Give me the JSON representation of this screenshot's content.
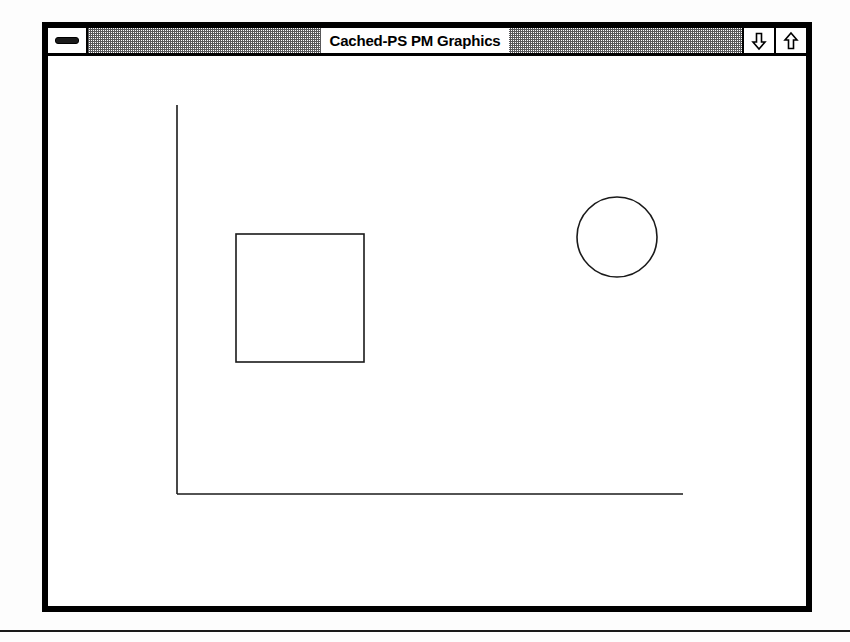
{
  "window": {
    "title": "Cached-PS PM Graphics",
    "frame": {
      "x": 42,
      "y": 22,
      "width": 770,
      "height": 590,
      "border_color": "#000000",
      "border_width": 6
    },
    "titlebar": {
      "height": 28,
      "style": "dithered-50-percent-gray",
      "pattern_color": "#58585a",
      "background_color": "#ffffff",
      "title_plate_color": "#ffffff",
      "title_text_color": "#000000",
      "sysmenu": {
        "name": "system-menu-button",
        "glyph": "dash",
        "tooltip": "System Menu"
      },
      "buttons": [
        {
          "name": "minimize-button",
          "glyph": "arrow-down",
          "label": "Minimize"
        },
        {
          "name": "maximize-button",
          "glyph": "arrow-up",
          "label": "Maximize"
        }
      ]
    },
    "client": {
      "background_color": "#ffffff",
      "width": 758,
      "height": 559
    }
  },
  "chart_data": {
    "type": "line",
    "title": "Cached-PS PM Graphics",
    "xlabel": "",
    "ylabel": "",
    "grid": false,
    "legend": "none",
    "stroke_color": "#1a1a1a",
    "stroke_width": 1.6,
    "canvas": {
      "width": 758,
      "height": 559
    },
    "annotations": [],
    "shapes": [
      {
        "name": "y-axis-line",
        "kind": "line",
        "x1": 129,
        "y1": 49,
        "x2": 129,
        "y2": 438,
        "stroke": "#1a1a1a",
        "stroke_width": 1.6
      },
      {
        "name": "x-axis-line",
        "kind": "line",
        "x1": 129,
        "y1": 438,
        "x2": 635,
        "y2": 438,
        "stroke": "#1a1a1a",
        "stroke_width": 1.6
      },
      {
        "name": "rectangle-shape",
        "kind": "rect",
        "x": 188,
        "y": 178,
        "width": 128,
        "height": 128,
        "stroke": "#1a1a1a",
        "stroke_width": 1.6,
        "fill": "none"
      },
      {
        "name": "circle-shape",
        "kind": "circle",
        "cx": 569,
        "cy": 181,
        "r": 40,
        "stroke": "#1a1a1a",
        "stroke_width": 1.6,
        "fill": "none"
      }
    ]
  },
  "page": {
    "background_color": "#fdfdfd",
    "rule": {
      "name": "page-footer-rule",
      "y": 630,
      "width": 850,
      "height": 2,
      "color": "#1a1a1a"
    }
  }
}
